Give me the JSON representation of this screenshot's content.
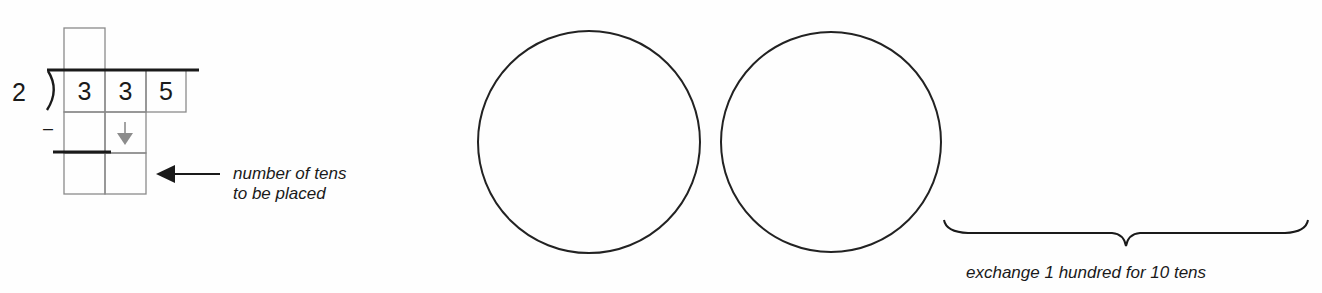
{
  "division": {
    "divisor": "2",
    "dividend_digits": [
      "3",
      "3",
      "5"
    ],
    "minus_sign": "–",
    "quotient_cells": [
      ""
    ],
    "subtract_cells": [
      "",
      ""
    ],
    "result_cells": [
      "",
      ""
    ]
  },
  "annotations": {
    "tens_label_line1": "number of tens",
    "tens_label_line2": "to be placed",
    "exchange_label": "exchange 1 hundred for 10 tens"
  },
  "circles": {
    "count": 2,
    "stroke_color": "#222222"
  },
  "colors": {
    "grid_line": "#8a8a8a",
    "ink": "#1a1a1a",
    "down_arrow": "#8c8c8c"
  }
}
